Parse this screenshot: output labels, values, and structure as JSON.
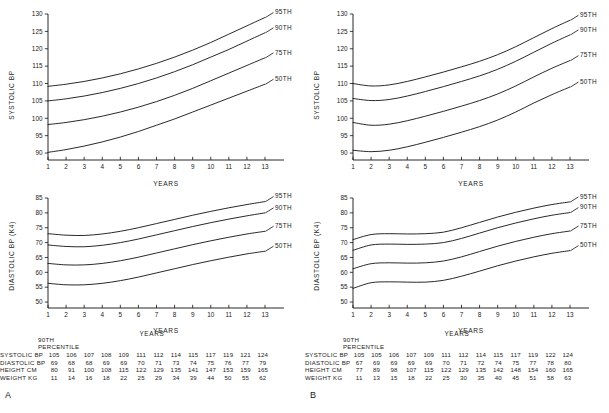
{
  "figure": {
    "panels": [
      {
        "letter": "A",
        "charts": [
          {
            "chart_data": {
              "type": "line",
              "title": "",
              "xlabel": "YEARS",
              "ylabel": "SYSTOLIC BP",
              "xlim": [
                1,
                13
              ],
              "ylim": [
                88,
                130
              ],
              "yticks": [
                90,
                95,
                100,
                105,
                110,
                115,
                120,
                125,
                130
              ],
              "xticks": [
                1,
                2,
                3,
                4,
                5,
                6,
                7,
                8,
                9,
                10,
                11,
                12,
                13
              ],
              "grid": false,
              "legend_position": "right-of-curve-ends",
              "x": [
                1,
                2,
                3,
                4,
                5,
                6,
                7,
                8,
                9,
                10,
                11,
                12,
                13
              ],
              "series": [
                {
                  "name": "95TH",
                  "values": [
                    109.2,
                    109.8,
                    110.6,
                    111.6,
                    112.8,
                    114.2,
                    115.8,
                    117.6,
                    119.6,
                    121.8,
                    124.2,
                    126.6,
                    129.0
                  ]
                },
                {
                  "name": "90TH",
                  "values": [
                    105.0,
                    105.6,
                    106.4,
                    107.4,
                    108.6,
                    110.0,
                    111.6,
                    113.4,
                    115.4,
                    117.6,
                    119.8,
                    122.2,
                    124.6
                  ]
                },
                {
                  "name": "75TH",
                  "values": [
                    98.2,
                    98.8,
                    99.6,
                    100.6,
                    101.8,
                    103.2,
                    104.8,
                    106.6,
                    108.6,
                    110.8,
                    113.0,
                    115.2,
                    117.4
                  ]
                },
                {
                  "name": "50TH",
                  "values": [
                    90.2,
                    91.0,
                    92.0,
                    93.2,
                    94.6,
                    96.2,
                    98.0,
                    99.8,
                    101.8,
                    103.8,
                    105.8,
                    107.8,
                    109.8
                  ]
                }
              ]
            }
          },
          {
            "chart_data": {
              "type": "line",
              "title": "",
              "xlabel": "YEARS",
              "ylabel": "DIASTOLIC BP (K4)",
              "xlim": [
                1,
                13
              ],
              "ylim": [
                48,
                85
              ],
              "yticks": [
                50,
                55,
                60,
                65,
                70,
                75,
                80,
                85
              ],
              "xticks": [
                1,
                2,
                3,
                4,
                5,
                6,
                7,
                8,
                9,
                10,
                11,
                12,
                13
              ],
              "grid": false,
              "legend_position": "right-of-curve-ends",
              "x": [
                1,
                2,
                3,
                4,
                5,
                6,
                7,
                8,
                9,
                10,
                11,
                12,
                13
              ],
              "series": [
                {
                  "name": "95TH",
                  "values": [
                    73.0,
                    72.5,
                    72.4,
                    72.9,
                    73.8,
                    75.0,
                    76.4,
                    77.8,
                    79.2,
                    80.5,
                    81.7,
                    82.8,
                    83.8
                  ]
                },
                {
                  "name": "90TH",
                  "values": [
                    69.2,
                    68.7,
                    68.6,
                    69.1,
                    70.0,
                    71.2,
                    72.6,
                    74.0,
                    75.4,
                    76.7,
                    77.9,
                    79.0,
                    80.0
                  ]
                },
                {
                  "name": "75TH",
                  "values": [
                    63.0,
                    62.5,
                    62.5,
                    63.0,
                    63.9,
                    65.1,
                    66.5,
                    67.9,
                    69.3,
                    70.6,
                    71.8,
                    72.9,
                    73.8
                  ]
                },
                {
                  "name": "50TH",
                  "values": [
                    56.3,
                    55.8,
                    55.8,
                    56.3,
                    57.2,
                    58.4,
                    59.8,
                    61.2,
                    62.6,
                    63.9,
                    65.1,
                    66.2,
                    67.1
                  ]
                }
              ]
            }
          }
        ],
        "table": {
          "header_line1": "90TH",
          "header_line2": "PERCENTILE",
          "years_label": "YEARS",
          "rows": [
            {
              "label": "SYSTOLIC BP",
              "values": [
                105,
                106,
                107,
                108,
                109,
                111,
                112,
                114,
                115,
                117,
                119,
                121,
                124
              ]
            },
            {
              "label": "DIASTOLIC BP",
              "values": [
                69,
                68,
                68,
                69,
                69,
                70,
                71,
                73,
                74,
                75,
                76,
                77,
                79
              ]
            },
            {
              "label": "HEIGHT CM",
              "values": [
                80,
                91,
                100,
                108,
                115,
                122,
                129,
                135,
                141,
                147,
                153,
                159,
                165
              ]
            },
            {
              "label": "WEIGHT KG",
              "values": [
                11,
                14,
                16,
                18,
                22,
                25,
                29,
                34,
                39,
                44,
                50,
                55,
                62
              ]
            }
          ]
        }
      },
      {
        "letter": "B",
        "charts": [
          {
            "chart_data": {
              "type": "line",
              "title": "",
              "xlabel": "YEARS",
              "ylabel": "SYSTOLIC BP",
              "xlim": [
                1,
                13
              ],
              "ylim": [
                88,
                130
              ],
              "yticks": [
                90,
                95,
                100,
                105,
                110,
                115,
                120,
                125,
                130
              ],
              "xticks": [
                1,
                2,
                3,
                4,
                5,
                6,
                7,
                8,
                9,
                10,
                11,
                12,
                13
              ],
              "grid": false,
              "legend_position": "right-of-curve-ends",
              "x": [
                1,
                2,
                3,
                4,
                5,
                6,
                7,
                8,
                9,
                10,
                11,
                12,
                13
              ],
              "series": [
                {
                  "name": "95TH",
                  "values": [
                    110.0,
                    109.3,
                    109.6,
                    110.6,
                    111.9,
                    113.3,
                    114.8,
                    116.4,
                    118.3,
                    120.6,
                    123.2,
                    125.8,
                    128.2
                  ]
                },
                {
                  "name": "90TH",
                  "values": [
                    105.7,
                    105.1,
                    105.4,
                    106.4,
                    107.7,
                    109.1,
                    110.6,
                    112.2,
                    114.1,
                    116.4,
                    119.0,
                    121.6,
                    124.0
                  ]
                },
                {
                  "name": "75TH",
                  "values": [
                    98.8,
                    98.0,
                    98.3,
                    99.3,
                    100.6,
                    102.0,
                    103.5,
                    105.1,
                    107.0,
                    109.3,
                    111.9,
                    114.4,
                    116.6
                  ]
                },
                {
                  "name": "50TH",
                  "values": [
                    90.8,
                    90.4,
                    90.8,
                    91.8,
                    93.1,
                    94.5,
                    96.0,
                    97.6,
                    99.5,
                    101.8,
                    104.4,
                    106.8,
                    109.0
                  ]
                }
              ]
            }
          },
          {
            "chart_data": {
              "type": "line",
              "title": "",
              "xlabel": "YEARS",
              "ylabel": "DIASTOLIC BP (K4)",
              "xlim": [
                1,
                13
              ],
              "ylim": [
                48,
                85
              ],
              "yticks": [
                50,
                55,
                60,
                65,
                70,
                75,
                80,
                85
              ],
              "xticks": [
                1,
                2,
                3,
                4,
                5,
                6,
                7,
                8,
                9,
                10,
                11,
                12,
                13
              ],
              "grid": false,
              "legend_position": "right-of-curve-ends",
              "x": [
                1,
                2,
                3,
                4,
                5,
                6,
                7,
                8,
                9,
                10,
                11,
                12,
                13
              ],
              "series": [
                {
                  "name": "95TH",
                  "values": [
                    71.0,
                    72.7,
                    73.0,
                    72.9,
                    73.0,
                    73.5,
                    75.0,
                    76.8,
                    78.6,
                    80.2,
                    81.6,
                    82.8,
                    83.7
                  ]
                },
                {
                  "name": "90TH",
                  "values": [
                    67.4,
                    69.2,
                    69.5,
                    69.4,
                    69.5,
                    70.0,
                    71.4,
                    73.2,
                    75.0,
                    76.6,
                    78.0,
                    79.2,
                    80.1
                  ]
                },
                {
                  "name": "75TH",
                  "values": [
                    61.2,
                    62.9,
                    63.2,
                    63.1,
                    63.2,
                    63.8,
                    65.2,
                    67.0,
                    68.8,
                    70.4,
                    71.8,
                    73.0,
                    73.9
                  ]
                },
                {
                  "name": "50TH",
                  "values": [
                    54.6,
                    56.5,
                    56.8,
                    56.7,
                    56.7,
                    57.3,
                    58.7,
                    60.4,
                    62.2,
                    63.8,
                    65.2,
                    66.4,
                    67.3
                  ]
                }
              ]
            }
          }
        ],
        "table": {
          "header_line1": "90TH",
          "header_line2": "PERCENTILE",
          "years_label": "YEARS",
          "rows": [
            {
              "label": "SYSTOLIC BP",
              "values": [
                105,
                105,
                106,
                107,
                109,
                111,
                112,
                114,
                115,
                117,
                119,
                122,
                124
              ]
            },
            {
              "label": "DIASTOLIC BP",
              "values": [
                67,
                69,
                69,
                69,
                69,
                70,
                71,
                72,
                74,
                75,
                77,
                78,
                80
              ]
            },
            {
              "label": "HEIGHT CM",
              "values": [
                77,
                89,
                98,
                107,
                115,
                122,
                129,
                135,
                142,
                148,
                154,
                160,
                165
              ]
            },
            {
              "label": "WEIGHT KG",
              "values": [
                11,
                13,
                15,
                18,
                22,
                25,
                30,
                35,
                40,
                45,
                51,
                58,
                63
              ]
            }
          ]
        }
      }
    ]
  }
}
